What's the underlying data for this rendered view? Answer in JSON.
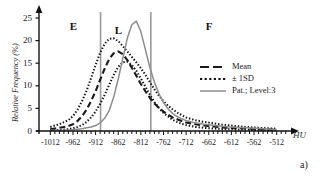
{
  "figure": {
    "panel_label": "a)"
  },
  "chart_data": {
    "type": "line",
    "title": "",
    "xlabel": "HU",
    "ylabel": "Relative Frequency (%)",
    "xlim": [
      -1037,
      -487
    ],
    "ylim": [
      0,
      25
    ],
    "grid": false,
    "legend_position": "right-middle",
    "xticks": [
      -1012,
      -962,
      -912,
      -862,
      -812,
      -762,
      -712,
      -662,
      -612,
      -562,
      -512
    ],
    "yticks": [
      0,
      5,
      10,
      15,
      20,
      25
    ],
    "xtick_labels": [
      "-1012",
      "-962",
      "-912",
      "-862",
      "-812",
      "-762",
      "-712",
      "-662",
      "-612",
      "-562",
      "-512"
    ],
    "ytick_labels": [
      "0",
      "5",
      "10",
      "15",
      "20",
      "25"
    ],
    "region_labels": [
      {
        "label": "E",
        "x": -960,
        "y": 23.0
      },
      {
        "label": "L",
        "x": -861,
        "y": 22.2
      },
      {
        "label": "F",
        "x": -660,
        "y": 23.0
      }
    ],
    "vertical_markers": [
      {
        "x": -901,
        "color": "#9a9a9a"
      },
      {
        "x": -790,
        "color": "#9a9a9a"
      }
    ],
    "series": [
      {
        "name": "Mean",
        "style": "dashed",
        "color": "#1a1a1a",
        "x": [
          -1012,
          -992,
          -972,
          -962,
          -952,
          -942,
          -932,
          -922,
          -912,
          -902,
          -892,
          -882,
          -872,
          -862,
          -852,
          -842,
          -832,
          -822,
          -812,
          -802,
          -792,
          -782,
          -772,
          -762,
          -752,
          -742,
          -732,
          -722,
          -712,
          -692,
          -672,
          -652,
          -632,
          -612,
          -592,
          -572,
          -552,
          -532,
          -512
        ],
        "y": [
          0.4,
          0.7,
          1.1,
          1.5,
          2.2,
          3.3,
          4.7,
          6.6,
          8.8,
          11.3,
          13.8,
          15.9,
          17.2,
          17.6,
          17.0,
          15.7,
          14.0,
          12.2,
          10.4,
          8.8,
          7.3,
          6.1,
          5.1,
          4.3,
          3.6,
          3.0,
          2.6,
          2.2,
          1.9,
          1.5,
          1.2,
          1.0,
          0.8,
          0.7,
          0.6,
          0.5,
          0.4,
          0.35,
          0.3
        ]
      },
      {
        "name": "+1SD",
        "style": "dotted",
        "color": "#111111",
        "x": [
          -1012,
          -992,
          -972,
          -962,
          -952,
          -942,
          -932,
          -922,
          -912,
          -902,
          -892,
          -882,
          -872,
          -862,
          -852,
          -842,
          -832,
          -822,
          -812,
          -802,
          -792,
          -782,
          -772,
          -762,
          -752,
          -742,
          -732,
          -722,
          -712,
          -692,
          -672,
          -652,
          -632,
          -612,
          -592,
          -572,
          -552,
          -532,
          -512
        ],
        "y": [
          0.9,
          1.5,
          2.4,
          3.3,
          4.7,
          6.6,
          8.9,
          11.7,
          14.6,
          17.3,
          19.3,
          20.4,
          20.5,
          19.9,
          18.8,
          17.6,
          16.4,
          15.2,
          13.9,
          12.4,
          10.8,
          9.2,
          7.8,
          6.6,
          5.6,
          4.8,
          4.1,
          3.5,
          3.0,
          2.4,
          2.0,
          1.7,
          1.4,
          1.2,
          1.0,
          0.85,
          0.7,
          0.6,
          0.5
        ]
      },
      {
        "name": "-1SD",
        "style": "dotted",
        "color": "#111111",
        "x": [
          -1012,
          -992,
          -972,
          -962,
          -952,
          -942,
          -932,
          -922,
          -912,
          -902,
          -892,
          -882,
          -872,
          -862,
          -852,
          -842,
          -832,
          -822,
          -812,
          -802,
          -792,
          -782,
          -772,
          -762,
          -752,
          -742,
          -732,
          -722,
          -712,
          -692,
          -672,
          -652,
          -632,
          -612,
          -592,
          -572,
          -552,
          -532,
          -512
        ],
        "y": [
          0.15,
          0.25,
          0.4,
          0.6,
          0.9,
          1.3,
          2.0,
          3.0,
          4.3,
          6.0,
          8.0,
          10.2,
          12.4,
          14.2,
          15.2,
          15.3,
          14.6,
          13.3,
          11.6,
          9.8,
          8.0,
          6.4,
          5.1,
          4.0,
          3.2,
          2.5,
          2.0,
          1.6,
          1.3,
          0.9,
          0.7,
          0.55,
          0.45,
          0.35,
          0.3,
          0.25,
          0.2,
          0.18,
          0.15
        ]
      },
      {
        "name": "Pat.; Level:3",
        "style": "solid",
        "color": "#8d8d8d",
        "x": [
          -1012,
          -992,
          -972,
          -962,
          -952,
          -942,
          -932,
          -922,
          -912,
          -902,
          -892,
          -882,
          -872,
          -862,
          -852,
          -842,
          -832,
          -822,
          -812,
          -802,
          -792,
          -782,
          -772,
          -762,
          -752,
          -742,
          -732,
          -722,
          -712,
          -692,
          -672,
          -652,
          -632,
          -612,
          -592,
          -572,
          -552,
          -532,
          -512
        ],
        "y": [
          0.1,
          0.15,
          0.2,
          0.3,
          0.4,
          0.5,
          0.7,
          0.9,
          1.2,
          1.8,
          2.8,
          4.5,
          7.5,
          11.5,
          16.0,
          20.5,
          23.5,
          24.3,
          22.0,
          18.0,
          14.0,
          10.8,
          8.2,
          6.3,
          4.9,
          3.9,
          3.2,
          2.7,
          2.3,
          1.8,
          1.5,
          1.25,
          1.05,
          0.9,
          0.78,
          0.66,
          0.55,
          0.45,
          0.35
        ]
      }
    ],
    "legend_entries": [
      {
        "label": "Mean",
        "style": "dashed",
        "color": "#1a1a1a"
      },
      {
        "label": "± 1SD",
        "style": "dotted",
        "color": "#111111"
      },
      {
        "label": "Pat.; Level:3",
        "style": "solid",
        "color": "#8d8d8d"
      }
    ]
  }
}
